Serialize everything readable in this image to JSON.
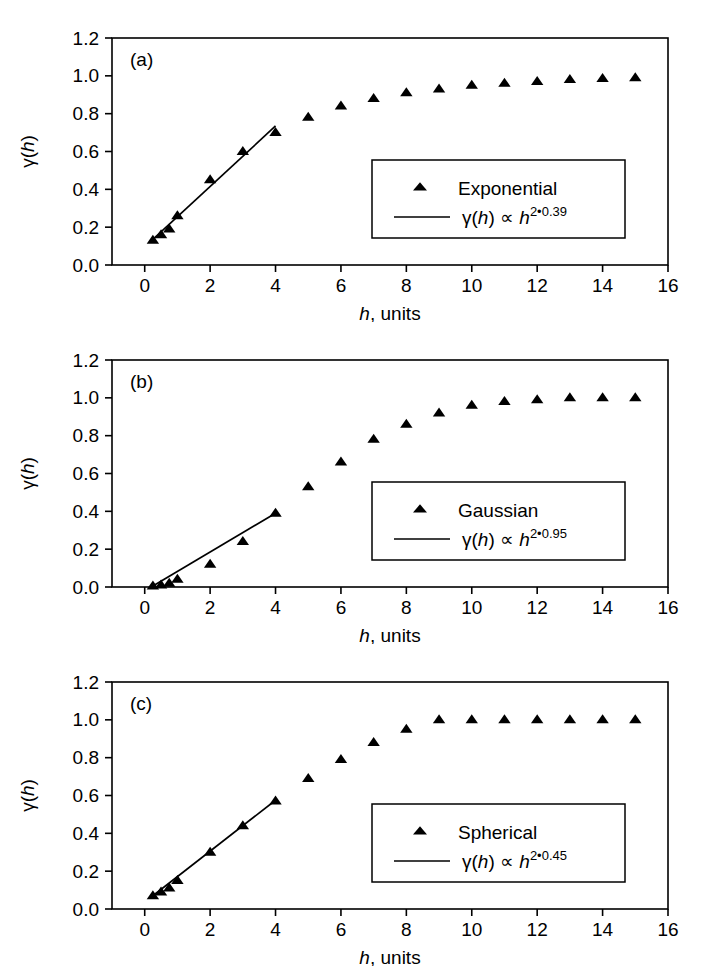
{
  "figure": {
    "background": "#ffffff",
    "ink": "#000000",
    "panel_count": 3
  },
  "axes": {
    "x": {
      "title_symbol": "h",
      "title_rest": ", units",
      "ticks": [
        "0",
        "2",
        "4",
        "6",
        "8",
        "10",
        "12",
        "14",
        "16"
      ],
      "tick_values": [
        0,
        2,
        4,
        6,
        8,
        10,
        12,
        14,
        16
      ],
      "min": -1,
      "max": 16
    },
    "y": {
      "title_pre": "γ(",
      "title_symbol": "h",
      "title_post": ")",
      "ticks": [
        "0.0",
        "0.2",
        "0.4",
        "0.6",
        "0.8",
        "1.0",
        "1.2"
      ],
      "tick_values": [
        0.0,
        0.2,
        0.4,
        0.6,
        0.8,
        1.0,
        1.2
      ],
      "min": 0,
      "max": 1.2
    }
  },
  "panels": [
    {
      "tag": "(a)",
      "legend": {
        "marker_label": "Exponential",
        "line_label_pre": "γ(",
        "line_label_sym": "h",
        "line_label_mid": ") ∝ ",
        "line_label_base": "h",
        "line_label_exp": "2•0.39"
      }
    },
    {
      "tag": "(b)",
      "legend": {
        "marker_label": "Gaussian",
        "line_label_pre": "γ(",
        "line_label_sym": "h",
        "line_label_mid": ") ∝ ",
        "line_label_base": "h",
        "line_label_exp": "2•0.95"
      }
    },
    {
      "tag": "(c)",
      "legend": {
        "marker_label": "Spherical",
        "line_label_pre": "γ(",
        "line_label_sym": "h",
        "line_label_mid": ") ∝ ",
        "line_label_base": "h",
        "line_label_exp": "2•0.45"
      }
    }
  ],
  "chart_data": [
    {
      "type": "scatter",
      "title": "(a) Exponential variogram",
      "xlabel": "h, units",
      "ylabel": "γ(h)",
      "xlim": [
        -1,
        16
      ],
      "ylim": [
        0,
        1.2
      ],
      "grid": false,
      "legend_position": "center-right",
      "series": [
        {
          "name": "Exponential",
          "kind": "markers",
          "marker": "triangle-up",
          "x": [
            0.25,
            0.5,
            0.75,
            1.0,
            2.0,
            3.0,
            4.0,
            5.0,
            6.0,
            7.0,
            8.0,
            9.0,
            10.0,
            11.0,
            12.0,
            13.0,
            14.0,
            15.0
          ],
          "y": [
            0.13,
            0.16,
            0.19,
            0.26,
            0.45,
            0.6,
            0.7,
            0.78,
            0.84,
            0.88,
            0.91,
            0.93,
            0.95,
            0.96,
            0.97,
            0.98,
            0.985,
            0.99
          ]
        },
        {
          "name": "γ(h) ∝ h^(2*0.39)",
          "kind": "line",
          "x": [
            0.25,
            4.0
          ],
          "y": [
            0.135,
            0.735
          ]
        }
      ]
    },
    {
      "type": "scatter",
      "title": "(b) Gaussian variogram",
      "xlabel": "h, units",
      "ylabel": "γ(h)",
      "xlim": [
        -1,
        16
      ],
      "ylim": [
        0,
        1.2
      ],
      "grid": false,
      "legend_position": "center-right",
      "series": [
        {
          "name": "Gaussian",
          "kind": "markers",
          "marker": "triangle-up",
          "x": [
            0.25,
            0.5,
            0.75,
            1.0,
            2.0,
            3.0,
            4.0,
            5.0,
            6.0,
            7.0,
            8.0,
            9.0,
            10.0,
            11.0,
            12.0,
            13.0,
            14.0,
            15.0
          ],
          "y": [
            0.005,
            0.01,
            0.02,
            0.04,
            0.12,
            0.24,
            0.39,
            0.53,
            0.66,
            0.78,
            0.86,
            0.92,
            0.96,
            0.98,
            0.99,
            1.0,
            1.0,
            1.0
          ]
        },
        {
          "name": "γ(h) ∝ h^(2*0.95)",
          "kind": "line",
          "x": [
            0.25,
            4.0
          ],
          "y": [
            0.005,
            0.39
          ]
        }
      ]
    },
    {
      "type": "scatter",
      "title": "(c) Spherical variogram",
      "xlabel": "h, units",
      "ylabel": "γ(h)",
      "xlim": [
        -1,
        16
      ],
      "ylim": [
        0,
        1.2
      ],
      "grid": false,
      "legend_position": "center-right",
      "series": [
        {
          "name": "Spherical",
          "kind": "markers",
          "marker": "triangle-up",
          "x": [
            0.25,
            0.5,
            0.75,
            1.0,
            2.0,
            3.0,
            4.0,
            5.0,
            6.0,
            7.0,
            8.0,
            9.0,
            10.0,
            11.0,
            12.0,
            13.0,
            14.0,
            15.0
          ],
          "y": [
            0.07,
            0.09,
            0.11,
            0.15,
            0.3,
            0.44,
            0.57,
            0.69,
            0.79,
            0.88,
            0.95,
            1.0,
            1.0,
            1.0,
            1.0,
            1.0,
            1.0,
            1.0
          ]
        },
        {
          "name": "γ(h) ∝ h^(2*0.45)",
          "kind": "line",
          "x": [
            0.25,
            4.0
          ],
          "y": [
            0.07,
            0.575
          ]
        }
      ]
    }
  ]
}
